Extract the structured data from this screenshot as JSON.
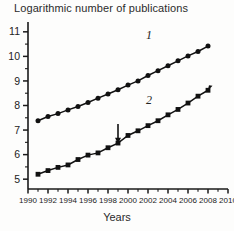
{
  "chart_data": {
    "type": "line",
    "title": "Logarithmic number of publications",
    "xlabel": "Years",
    "ylabel": "",
    "xlim": [
      1990,
      2010
    ],
    "ylim": [
      4.6,
      11.4
    ],
    "grid": false,
    "legend_position": "inline-annotation",
    "x_ticks": [
      1990,
      1992,
      1994,
      1996,
      1998,
      2000,
      2002,
      2004,
      2006,
      2008,
      2010
    ],
    "x_tick_labels": [
      "1990",
      "1992",
      "1994",
      "1996",
      "1998",
      "2000",
      "2002",
      "2004",
      "2006",
      "2008",
      "2010"
    ],
    "x_minor_ticks": [
      1991,
      1993,
      1995,
      1997,
      1999,
      2001,
      2003,
      2005,
      2007,
      2009
    ],
    "y_ticks": [
      5,
      6,
      7,
      8,
      9,
      10,
      11
    ],
    "y_tick_labels": [
      "5",
      "6",
      "7",
      "8",
      "9",
      "10",
      "11"
    ],
    "y_minor_ticks": [
      5.5,
      6.5,
      7.5,
      8.5,
      9.5,
      10.5
    ],
    "series": [
      {
        "name": "1",
        "marker": "circle",
        "label_text": "1",
        "label_x": 2002.1,
        "label_y": 10.72,
        "x": [
          1991,
          1992,
          1993,
          1994,
          1995,
          1996,
          1997,
          1998,
          1999,
          2000,
          2001,
          2002,
          2003,
          2004,
          2005,
          2006,
          2007,
          2008
        ],
        "values": [
          7.38,
          7.55,
          7.67,
          7.82,
          7.96,
          8.12,
          8.3,
          8.47,
          8.64,
          8.83,
          9.0,
          9.22,
          9.42,
          9.62,
          9.82,
          10.02,
          10.2,
          10.42
        ]
      },
      {
        "name": "2",
        "marker": "square",
        "label_text": "2",
        "label_x": 2002.1,
        "label_y": 8.05,
        "x": [
          1991,
          1992,
          1993,
          1994,
          1995,
          1996,
          1997,
          1998,
          1999,
          2000,
          2001,
          2002,
          2003,
          2004,
          2005,
          2006,
          2007,
          2008
        ],
        "values": [
          5.2,
          5.35,
          5.48,
          5.58,
          5.8,
          5.98,
          6.07,
          6.28,
          6.47,
          6.78,
          6.97,
          7.18,
          7.38,
          7.62,
          7.84,
          8.1,
          8.38,
          8.62
        ]
      }
    ],
    "annotations": [
      {
        "type": "arrow",
        "name": "intervention-arrow",
        "x": 1999.0,
        "y_from": 7.25,
        "y_to": 6.48
      }
    ]
  }
}
